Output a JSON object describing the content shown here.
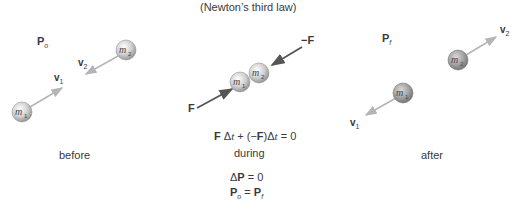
{
  "title": "(Newton’s third law)",
  "panels": {
    "before": {
      "caption": "before",
      "momentum_label": "P",
      "momentum_sub": "o",
      "v1_label": "v",
      "v1_sub": "1",
      "v2_label": "v",
      "v2_sub": "2",
      "m1_label": "m",
      "m1_sub": "1",
      "m2_label": "m",
      "m2_sub": "2"
    },
    "during": {
      "caption": "during",
      "force_left_label": "F",
      "force_right_label": "−F",
      "m1_label": "m",
      "m1_sub": "1",
      "m2_label": "m",
      "m2_sub": "2",
      "equation_part1": "F",
      "equation_part2": "Δ",
      "equation_part3": "t",
      "equation_part4": " + (−",
      "equation_part5": "F",
      "equation_part6": ")Δ",
      "equation_part7": "t",
      "equation_part8": " = 0"
    },
    "after": {
      "caption": "after",
      "momentum_label": "P",
      "momentum_sub": "f",
      "v1_label": "v",
      "v1_sub": "1",
      "v2_label": "v",
      "v2_sub": "2",
      "m1_label": "m",
      "m1_sub": "1",
      "m2_label": "m",
      "m2_sub": "2"
    }
  },
  "conclusions": {
    "delta_p_prefix": "Δ",
    "delta_p_symbol": "P",
    "delta_p_rest": " = 0",
    "conservation_left": "P",
    "conservation_left_sub": "o",
    "conservation_eq": " = ",
    "conservation_right": "P",
    "conservation_right_sub": "f"
  },
  "colors": {
    "velocity_arrow": "#b5b5b5",
    "force_arrow": "#555555",
    "ball_light": "#f2f2f2",
    "ball_dark": "#8a8a8a"
  }
}
